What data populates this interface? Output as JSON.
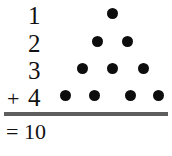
{
  "addends": [
    {
      "label": "1",
      "top": 3,
      "left": 28
    },
    {
      "label": "2",
      "top": 31,
      "left": 28
    },
    {
      "label": "3",
      "top": 58,
      "left": 28
    },
    {
      "label": "4",
      "top": 85,
      "left": 28
    }
  ],
  "plus_sign": "+",
  "result": "= 10",
  "caption": "",
  "dots": [
    [
      {
        "x": 112,
        "y": 13
      }
    ],
    [
      {
        "x": 97,
        "y": 41
      },
      {
        "x": 127,
        "y": 41
      }
    ],
    [
      {
        "x": 82,
        "y": 68
      },
      {
        "x": 112,
        "y": 68
      },
      {
        "x": 143,
        "y": 68
      }
    ],
    [
      {
        "x": 65,
        "y": 95
      },
      {
        "x": 94,
        "y": 95
      },
      {
        "x": 130,
        "y": 95
      },
      {
        "x": 158,
        "y": 95
      }
    ]
  ],
  "colors": {
    "dot": "#0d0d0d",
    "rule": "#5e5e5e",
    "text": "#111111"
  }
}
